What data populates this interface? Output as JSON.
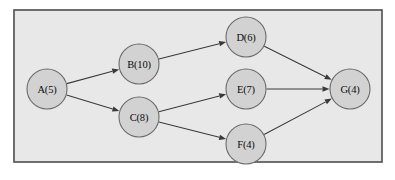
{
  "figure": {
    "kind": "directed-activity-network-diagram",
    "width": 395,
    "height": 180,
    "panel": {
      "x": 14,
      "y": 10,
      "width": 368,
      "height": 152,
      "background_color": "#e8e8e8",
      "border_color": "#4d4d4d"
    },
    "page_background_color": "#ffffff"
  },
  "style": {
    "node_fill_color": "#d2d2d2",
    "node_stroke_color": "#6a6a6a",
    "edge_color": "#3a3a3a",
    "label_color": "#0b0b0b",
    "node_radius": 20
  },
  "graph_data": {
    "type": "diagram",
    "directed": true,
    "node_count": 7,
    "edge_count": 8,
    "nodes": [
      {
        "id": "A",
        "label": "A(5)",
        "name": "A",
        "duration": 5,
        "cx": 47,
        "cy": 89,
        "r": 20
      },
      {
        "id": "B",
        "label": "B(10)",
        "name": "B",
        "duration": 10,
        "cx": 139,
        "cy": 64,
        "r": 20
      },
      {
        "id": "C",
        "label": "C(8)",
        "name": "C",
        "duration": 8,
        "cx": 139,
        "cy": 117,
        "r": 20
      },
      {
        "id": "D",
        "label": "D(6)",
        "name": "D",
        "duration": 6,
        "cx": 246,
        "cy": 37,
        "r": 20
      },
      {
        "id": "E",
        "label": "E(7)",
        "name": "E",
        "duration": 7,
        "cx": 246,
        "cy": 89,
        "r": 20
      },
      {
        "id": "F",
        "label": "F(4)",
        "name": "F",
        "duration": 4,
        "cx": 246,
        "cy": 144,
        "r": 20
      },
      {
        "id": "G",
        "label": "G(4)",
        "name": "G",
        "duration": 4,
        "cx": 350,
        "cy": 89,
        "r": 20
      }
    ],
    "edges": [
      {
        "id": "A-B",
        "from": "A",
        "to": "B"
      },
      {
        "id": "A-C",
        "from": "A",
        "to": "C"
      },
      {
        "id": "B-D",
        "from": "B",
        "to": "D"
      },
      {
        "id": "C-E",
        "from": "C",
        "to": "E"
      },
      {
        "id": "C-F",
        "from": "C",
        "to": "F"
      },
      {
        "id": "D-G",
        "from": "D",
        "to": "G"
      },
      {
        "id": "E-G",
        "from": "E",
        "to": "G"
      },
      {
        "id": "F-G",
        "from": "F",
        "to": "G"
      }
    ]
  }
}
